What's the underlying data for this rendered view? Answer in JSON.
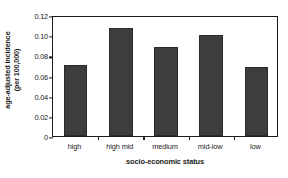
{
  "chart_data": {
    "type": "bar",
    "title": "",
    "xlabel": "socio-economic status",
    "ylabel_line1": "age-adjusted incidence",
    "ylabel_line2": "(per 100,000)",
    "categories": [
      "high",
      "high mid",
      "medium",
      "mid-low",
      "low"
    ],
    "values": [
      0.0705,
      0.1075,
      0.0885,
      0.1005,
      0.068
    ],
    "ylim": [
      0,
      0.12
    ],
    "yticks": [
      0,
      0.02,
      0.04,
      0.06,
      0.08,
      0.1,
      0.12
    ],
    "ytick_labels": [
      "0",
      "0.02",
      "0.04",
      "0.06",
      "0.08",
      "0.10",
      "0.12"
    ],
    "grid": false,
    "legend": "none",
    "bar_color": "#3d3d3d",
    "axis_color": "#1a1a1a",
    "background": "#ffffff"
  }
}
